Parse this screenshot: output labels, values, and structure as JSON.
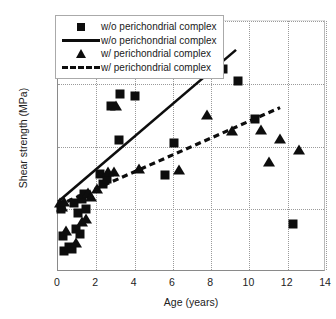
{
  "chart_data": {
    "type": "scatter",
    "title": "",
    "xlabel": "Age (years)",
    "ylabel": "Shear strength (MPa)",
    "xlim": [
      0,
      14
    ],
    "ylim": [
      0,
      2
    ],
    "xticks": [
      "0",
      "2",
      "4",
      "6",
      "8",
      "10",
      "12",
      "14"
    ],
    "xtick_values": [
      0,
      2,
      4,
      6,
      8,
      10,
      12,
      14
    ],
    "yticks": [
      "0",
      "0.5",
      "1",
      "1.5",
      "2"
    ],
    "ytick_values": [
      0,
      0.5,
      1,
      1.5,
      2
    ],
    "grid": "dotted both axes",
    "legend_position": "top-left inside",
    "marker_color": "#0d0d0d",
    "series": [
      {
        "name": "w/o perichondrial complex",
        "marker": "square",
        "points": [
          [
            0.15,
            0.5
          ],
          [
            0.25,
            0.29
          ],
          [
            0.3,
            0.17
          ],
          [
            0.55,
            0.2
          ],
          [
            0.75,
            0.18
          ],
          [
            0.85,
            0.55
          ],
          [
            0.95,
            0.34
          ],
          [
            1.05,
            0.47
          ],
          [
            1.15,
            0.3
          ],
          [
            1.25,
            0.58
          ],
          [
            1.35,
            0.62
          ],
          [
            1.45,
            0.5
          ],
          [
            2.2,
            0.78
          ],
          [
            2.35,
            0.7
          ],
          [
            2.55,
            0.74
          ],
          [
            2.75,
            1.32
          ],
          [
            3.0,
            1.62
          ],
          [
            3.2,
            1.05
          ],
          [
            3.25,
            1.42
          ],
          [
            4.0,
            1.4
          ],
          [
            5.6,
            0.77
          ],
          [
            6.05,
            1.03
          ],
          [
            8.6,
            1.62
          ],
          [
            9.4,
            1.52
          ],
          [
            10.3,
            1.22
          ],
          [
            12.3,
            0.38
          ]
        ]
      },
      {
        "name": "w/ perichondrial complex",
        "marker": "triangle",
        "points": [
          [
            0.1,
            0.55
          ],
          [
            0.2,
            0.52
          ],
          [
            0.3,
            0.56
          ],
          [
            0.4,
            0.33
          ],
          [
            0.95,
            0.23
          ],
          [
            1.25,
            0.4
          ],
          [
            1.45,
            0.42
          ],
          [
            1.55,
            0.63
          ],
          [
            1.7,
            0.6
          ],
          [
            2.05,
            0.66
          ],
          [
            2.6,
            0.8
          ],
          [
            2.9,
            0.8
          ],
          [
            3.05,
            1.32
          ],
          [
            4.25,
            0.82
          ],
          [
            6.3,
            0.81
          ],
          [
            7.8,
            1.25
          ],
          [
            9.1,
            1.12
          ],
          [
            10.6,
            1.13
          ],
          [
            11.0,
            0.88
          ],
          [
            11.6,
            1.06
          ],
          [
            12.6,
            0.97
          ]
        ]
      }
    ],
    "fits": [
      {
        "name": "w/o perichondrial complex",
        "style": "solid",
        "x_start": 0.0,
        "y_start": 0.56,
        "x_end": 9.3,
        "y_end": 1.77
      },
      {
        "name": "w/ perichondrial complex",
        "style": "dashed",
        "x_start": 0.0,
        "y_start": 0.53,
        "x_end": 11.6,
        "y_end": 1.31
      }
    ]
  },
  "legend": {
    "entries": [
      {
        "key": "square-marker",
        "label": "w/o perichondrial complex"
      },
      {
        "key": "solid-line",
        "label": "w/o perichondrial complex"
      },
      {
        "key": "triangle-marker",
        "label": "w/ perichondrial complex"
      },
      {
        "key": "dashed-line",
        "label": "w/ perichondrial complex"
      }
    ]
  }
}
